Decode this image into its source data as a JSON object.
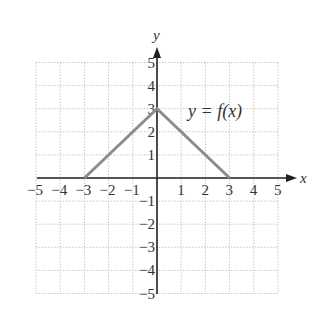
{
  "chart_data": {
    "type": "line",
    "title": "",
    "xlabel": "x",
    "ylabel": "y",
    "xlim": [
      -5,
      5
    ],
    "ylim": [
      -5,
      5
    ],
    "grid": true,
    "x_ticks": [
      "-5",
      "-4",
      "-3",
      "-2",
      "-1",
      "1",
      "2",
      "3",
      "4",
      "5"
    ],
    "y_ticks": [
      "5",
      "4",
      "3",
      "2",
      "1",
      "-1",
      "-2",
      "-3",
      "-4",
      "-5"
    ],
    "series": [
      {
        "name": "y = f(x)",
        "x": [
          -3,
          0,
          3
        ],
        "y": [
          0,
          3,
          0
        ]
      }
    ],
    "annotations": [
      {
        "text": "y = f(x)",
        "x": 1.2,
        "y": 3
      }
    ]
  },
  "colors": {
    "axis": "#222222",
    "grid": "#c8c8c8",
    "curve": "#8c8c8c",
    "text": "#333333"
  },
  "labels": {
    "x_axis": "x",
    "y_axis": "y",
    "function": "y = f(x)"
  }
}
